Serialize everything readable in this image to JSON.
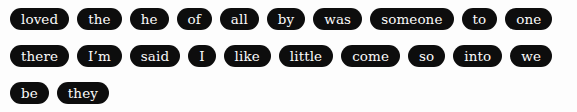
{
  "tag_cloud": {
    "background_color": "#fdfdfd",
    "pill_color": "#0d0d0d",
    "text_color": "#fbfbfb",
    "rows": [
      [
        "loved",
        "the",
        "he",
        "of",
        "all",
        "by",
        "was",
        "someone",
        "to",
        "one"
      ],
      [
        "there",
        "I’m",
        "said",
        "I",
        "like",
        "little",
        "come",
        "so",
        "into",
        "we"
      ],
      [
        "be",
        "they"
      ]
    ],
    "tags": [
      "loved",
      "the",
      "he",
      "of",
      "all",
      "by",
      "was",
      "someone",
      "to",
      "one",
      "there",
      "I’m",
      "said",
      "I",
      "like",
      "little",
      "come",
      "so",
      "into",
      "we",
      "be",
      "they"
    ],
    "tag_count": 22
  }
}
